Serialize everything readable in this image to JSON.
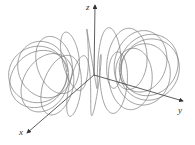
{
  "figure": {
    "axes": {
      "x_label": "x",
      "y_label": "y",
      "z_label": "z",
      "origin_px": [
        94,
        75
      ],
      "x_end_px": [
        27,
        133
      ],
      "y_end_px": [
        183,
        101
      ],
      "z_end_px": [
        95,
        5
      ]
    },
    "curve": {
      "type": "toroidal-spiral",
      "major_radius_px": 54,
      "minor_radius_px": 28,
      "windings": 18,
      "depth_dx": -0.32,
      "depth_dy": 0.26,
      "center_px": [
        94,
        72
      ],
      "stroke": "#777777"
    },
    "colors": {
      "axis": "#333333",
      "curve": "#777777",
      "background": "#ffffff"
    }
  }
}
